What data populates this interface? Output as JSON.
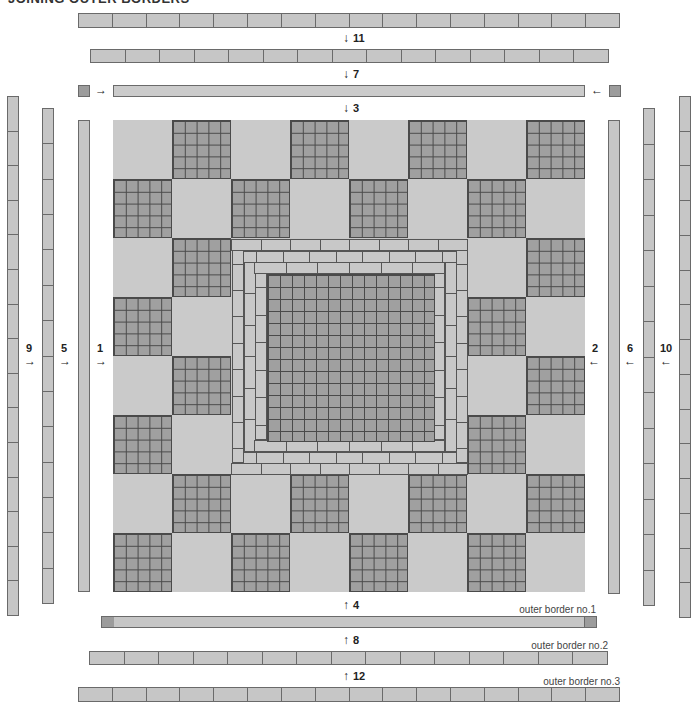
{
  "title": "JOINING OUTER BORDERS",
  "steps": {
    "s1": "1",
    "s2": "2",
    "s3": "3",
    "s4": "4",
    "s5": "5",
    "s6": "6",
    "s7": "7",
    "s8": "8",
    "s9": "9",
    "s10": "10",
    "s11": "11",
    "s12": "12"
  },
  "arrows": {
    "right": "→",
    "left": "←",
    "down": "↓",
    "up": "↑"
  },
  "captions": {
    "border1": "outer border no.1",
    "border2": "outer border no.2",
    "border3": "outer border no.3"
  },
  "quilt": {
    "grid": "8x8 blocks",
    "block_pattern": "checkerboard of plain light squares and 5x5 dark nine-patch-style grids",
    "center": "3 rings of light brick strips around a 14x14 dark grid",
    "colors": {
      "light": "#cacaca",
      "dark": "#a0a0a0",
      "line": "#4a4a4a"
    }
  }
}
